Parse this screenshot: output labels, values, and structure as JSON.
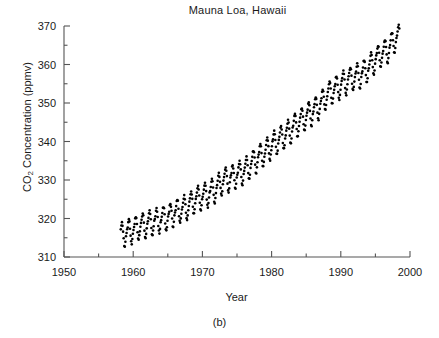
{
  "figure": {
    "title": "Mauna Loa, Hawaii",
    "caption": "(b)",
    "xlabel": "Year",
    "ylabel_main": "Concentration (ppmv)",
    "ylabel_prefix": "CO",
    "ylabel_sub": "2"
  },
  "chart_data": {
    "type": "scatter",
    "title": "Mauna Loa, Hawaii",
    "subtitle": "(b)",
    "xlabel": "Year",
    "ylabel": "CO2 Concentration (ppmv)",
    "xlim": [
      1950,
      2000
    ],
    "ylim": [
      310,
      370
    ],
    "xticks": [
      1950,
      1960,
      1970,
      1980,
      1990,
      2000
    ],
    "xtick_labels": [
      "1950",
      "1960",
      "1970",
      "1980",
      "1990",
      "2000"
    ],
    "xminor_step": 5,
    "yticks": [
      310,
      320,
      330,
      340,
      350,
      360,
      370
    ],
    "ytick_labels": [
      "310",
      "320",
      "330",
      "340",
      "350",
      "360",
      "370"
    ],
    "yminor_step": 5,
    "grid": false,
    "legend": null,
    "marker": "filled-circle",
    "marker_color": "#000000",
    "marker_size_px": 2.6,
    "series_name": "Monthly mean atmospheric CO2",
    "data_start_year": 1958.2,
    "data_end_year": 1998.5,
    "sampling": "monthly",
    "seasonal_amplitude_ppmv": 3.1,
    "seasonal_peak_month": 5,
    "seasonal_min_month": 10,
    "annual_means": [
      {
        "year": 1958,
        "co2": 315.3
      },
      {
        "year": 1959,
        "co2": 315.98
      },
      {
        "year": 1960,
        "co2": 316.91
      },
      {
        "year": 1961,
        "co2": 317.64
      },
      {
        "year": 1962,
        "co2": 318.45
      },
      {
        "year": 1963,
        "co2": 318.99
      },
      {
        "year": 1964,
        "co2": 319.62
      },
      {
        "year": 1965,
        "co2": 320.04
      },
      {
        "year": 1966,
        "co2": 321.37
      },
      {
        "year": 1967,
        "co2": 322.18
      },
      {
        "year": 1968,
        "co2": 323.05
      },
      {
        "year": 1969,
        "co2": 324.62
      },
      {
        "year": 1970,
        "co2": 325.68
      },
      {
        "year": 1971,
        "co2": 326.32
      },
      {
        "year": 1972,
        "co2": 327.46
      },
      {
        "year": 1973,
        "co2": 329.68
      },
      {
        "year": 1974,
        "co2": 330.19
      },
      {
        "year": 1975,
        "co2": 331.12
      },
      {
        "year": 1976,
        "co2": 332.03
      },
      {
        "year": 1977,
        "co2": 333.84
      },
      {
        "year": 1978,
        "co2": 335.41
      },
      {
        "year": 1979,
        "co2": 336.84
      },
      {
        "year": 1980,
        "co2": 338.76
      },
      {
        "year": 1981,
        "co2": 340.12
      },
      {
        "year": 1982,
        "co2": 341.48
      },
      {
        "year": 1983,
        "co2": 343.15
      },
      {
        "year": 1984,
        "co2": 344.85
      },
      {
        "year": 1985,
        "co2": 346.35
      },
      {
        "year": 1986,
        "co2": 347.61
      },
      {
        "year": 1987,
        "co2": 349.31
      },
      {
        "year": 1988,
        "co2": 351.69
      },
      {
        "year": 1989,
        "co2": 353.2
      },
      {
        "year": 1990,
        "co2": 354.45
      },
      {
        "year": 1991,
        "co2": 355.7
      },
      {
        "year": 1992,
        "co2": 356.54
      },
      {
        "year": 1993,
        "co2": 357.21
      },
      {
        "year": 1994,
        "co2": 358.96
      },
      {
        "year": 1995,
        "co2": 360.97
      },
      {
        "year": 1996,
        "co2": 362.74
      },
      {
        "year": 1997,
        "co2": 363.88
      },
      {
        "year": 1998,
        "co2": 366.84
      }
    ],
    "monthly_seasonal_offsets": [
      0.2,
      0.9,
      1.7,
      2.9,
      3.3,
      2.6,
      1.0,
      -1.1,
      -2.8,
      -3.2,
      -2.1,
      -0.7
    ],
    "observed_min_ppmv": 313.0,
    "observed_max_ppmv": 369.5
  },
  "axes_geometry": {
    "plot_left_px": 64,
    "plot_right_px": 410,
    "plot_top_px": 26,
    "plot_bottom_px": 257
  }
}
